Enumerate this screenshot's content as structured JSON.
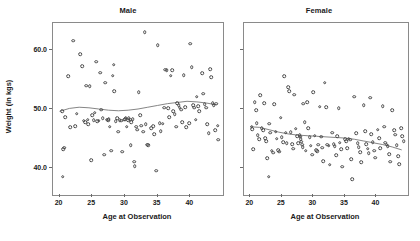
{
  "figure": {
    "background": "#ffffff",
    "marker_color": "#4a4a4a",
    "trend_color": "#777777",
    "frame_color": "#8a8a8a"
  },
  "chart_data": {
    "type": "scatter",
    "title": "",
    "xlabel": "Age at Observation",
    "ylabel": "Weight (in kgs)",
    "xlim": [
      19,
      45
    ],
    "ylim": [
      35.5,
      64.5
    ],
    "xticks": [
      20,
      25,
      30,
      35,
      40
    ],
    "yticks": [
      40.0,
      50.0,
      60.0
    ],
    "ytick_labels": [
      "40.0",
      "50.0",
      "60.0"
    ],
    "xtick_labels": [
      "20",
      "25",
      "30",
      "35",
      "40"
    ],
    "grid": false,
    "legend": "none",
    "panels": [
      {
        "label": "Male",
        "trend_line": {
          "x": [
            20.0,
            21.5,
            23.0,
            24.5,
            26.0,
            27.5,
            29.0,
            30.5,
            32.0,
            33.5,
            35.0,
            36.5,
            38.0,
            39.5,
            41.0,
            42.5,
            44.0
          ],
          "y": [
            49.6,
            50.1,
            50.3,
            50.2,
            50.0,
            49.8,
            49.7,
            49.8,
            50.0,
            50.3,
            50.6,
            50.9,
            51.1,
            51.3,
            51.2,
            51.0,
            50.7
          ]
        },
        "points": [
          [
            20.4,
            49.6
          ],
          [
            20.6,
            43.2
          ],
          [
            20.7,
            43.5
          ],
          [
            20.5,
            38.6
          ],
          [
            20.9,
            48.6
          ],
          [
            21.3,
            55.5
          ],
          [
            21.6,
            46.9
          ],
          [
            22.1,
            61.5
          ],
          [
            22.4,
            47.1
          ],
          [
            22.6,
            49.2
          ],
          [
            23.2,
            59.2
          ],
          [
            23.5,
            57.2
          ],
          [
            23.7,
            48.0
          ],
          [
            23.9,
            47.8
          ],
          [
            24.1,
            53.9
          ],
          [
            24.3,
            48.2
          ],
          [
            24.4,
            47.4
          ],
          [
            24.6,
            53.8
          ],
          [
            24.8,
            41.4
          ],
          [
            25.0,
            49.0
          ],
          [
            25.2,
            48.1
          ],
          [
            25.4,
            49.4
          ],
          [
            25.6,
            58.0
          ],
          [
            25.8,
            47.9
          ],
          [
            26.0,
            48.0
          ],
          [
            26.2,
            56.1
          ],
          [
            26.4,
            49.9
          ],
          [
            26.6,
            48.4
          ],
          [
            26.8,
            42.3
          ],
          [
            27.0,
            54.4
          ],
          [
            27.2,
            48.2
          ],
          [
            27.4,
            48.1
          ],
          [
            27.5,
            48.3
          ],
          [
            27.7,
            47.0
          ],
          [
            27.9,
            43.0
          ],
          [
            28.1,
            55.6
          ],
          [
            28.3,
            57.5
          ],
          [
            28.4,
            53.0
          ],
          [
            28.6,
            47.9
          ],
          [
            28.8,
            48.4
          ],
          [
            29.0,
            46.2
          ],
          [
            29.2,
            48.1
          ],
          [
            29.4,
            48.0
          ],
          [
            29.6,
            42.8
          ],
          [
            29.9,
            48.2
          ],
          [
            30.0,
            48.3
          ],
          [
            30.1,
            48.5
          ],
          [
            30.3,
            47.0
          ],
          [
            30.5,
            48.1
          ],
          [
            30.6,
            48.4
          ],
          [
            30.8,
            48.2
          ],
          [
            30.9,
            43.9
          ],
          [
            31.0,
            47.8
          ],
          [
            31.2,
            48.3
          ],
          [
            31.4,
            41.1
          ],
          [
            31.5,
            40.4
          ],
          [
            31.7,
            47.0
          ],
          [
            31.9,
            46.5
          ],
          [
            32.1,
            52.8
          ],
          [
            32.3,
            49.0
          ],
          [
            32.5,
            47.2
          ],
          [
            32.8,
            46.2
          ],
          [
            33.0,
            62.9
          ],
          [
            33.2,
            47.4
          ],
          [
            33.4,
            44.0
          ],
          [
            33.6,
            43.9
          ],
          [
            34.0,
            46.8
          ],
          [
            34.3,
            47.1
          ],
          [
            34.5,
            45.8
          ],
          [
            34.8,
            39.6
          ],
          [
            35.0,
            60.8
          ],
          [
            35.3,
            47.6
          ],
          [
            35.5,
            46.3
          ],
          [
            35.8,
            47.5
          ],
          [
            36.0,
            50.2
          ],
          [
            36.2,
            56.6
          ],
          [
            36.4,
            56.5
          ],
          [
            36.6,
            50.1
          ],
          [
            36.8,
            48.6
          ],
          [
            37.0,
            55.6
          ],
          [
            37.2,
            56.5
          ],
          [
            37.4,
            49.6
          ],
          [
            37.6,
            49.1
          ],
          [
            37.8,
            47.0
          ],
          [
            38.0,
            51.0
          ],
          [
            38.2,
            50.6
          ],
          [
            38.4,
            50.2
          ],
          [
            38.6,
            49.9
          ],
          [
            38.8,
            47.8
          ],
          [
            39.0,
            55.7
          ],
          [
            39.2,
            50.3
          ],
          [
            39.4,
            46.9
          ],
          [
            39.8,
            47.6
          ],
          [
            40.0,
            61.0
          ],
          [
            40.2,
            57.0
          ],
          [
            40.4,
            50.6
          ],
          [
            40.6,
            50.2
          ],
          [
            40.8,
            48.2
          ],
          [
            41.0,
            52.1
          ],
          [
            41.2,
            50.5
          ],
          [
            41.4,
            49.6
          ],
          [
            41.8,
            56.0
          ],
          [
            42.0,
            52.6
          ],
          [
            42.2,
            50.8
          ],
          [
            42.4,
            50.2
          ],
          [
            42.6,
            47.4
          ],
          [
            42.8,
            45.9
          ],
          [
            43.0,
            56.7
          ],
          [
            43.2,
            55.4
          ],
          [
            43.4,
            51.0
          ],
          [
            43.6,
            50.6
          ],
          [
            43.8,
            46.4
          ],
          [
            44.0,
            50.9
          ],
          [
            44.2,
            47.2
          ],
          [
            44.3,
            44.8
          ]
        ]
      },
      {
        "label": "Female",
        "trend_line": {
          "x": [
            20.0,
            21.5,
            23.0,
            24.5,
            26.0,
            27.5,
            29.0,
            30.5,
            32.0,
            33.5,
            35.0,
            36.5,
            38.0,
            39.5,
            41.0,
            42.5,
            44.0
          ],
          "y": [
            47.0,
            46.9,
            46.5,
            46.1,
            45.8,
            45.6,
            45.5,
            45.4,
            45.3,
            45.2,
            45.1,
            44.9,
            44.6,
            44.3,
            44.0,
            43.6,
            43.1
          ]
        },
        "points": [
          [
            20.2,
            47.0
          ],
          [
            20.3,
            46.6
          ],
          [
            20.5,
            43.2
          ],
          [
            20.7,
            51.1
          ],
          [
            20.9,
            49.8
          ],
          [
            21.0,
            47.6
          ],
          [
            21.2,
            45.6
          ],
          [
            21.4,
            44.9
          ],
          [
            21.6,
            52.3
          ],
          [
            21.8,
            46.8
          ],
          [
            22.0,
            46.4
          ],
          [
            22.2,
            51.0
          ],
          [
            22.4,
            45.1
          ],
          [
            22.5,
            44.6
          ],
          [
            22.7,
            41.7
          ],
          [
            22.9,
            38.6
          ],
          [
            23.0,
            47.5
          ],
          [
            23.2,
            46.0
          ],
          [
            23.4,
            43.0
          ],
          [
            23.6,
            42.6
          ],
          [
            23.8,
            50.8
          ],
          [
            24.0,
            46.2
          ],
          [
            24.2,
            45.0
          ],
          [
            24.4,
            43.1
          ],
          [
            24.6,
            42.8
          ],
          [
            24.8,
            48.5
          ],
          [
            25.0,
            45.2
          ],
          [
            25.2,
            44.4
          ],
          [
            25.4,
            55.5
          ],
          [
            25.6,
            46.0
          ],
          [
            25.8,
            44.2
          ],
          [
            26.0,
            53.7
          ],
          [
            26.2,
            53.0
          ],
          [
            26.4,
            46.1
          ],
          [
            26.6,
            44.1
          ],
          [
            26.8,
            43.3
          ],
          [
            27.0,
            52.4
          ],
          [
            27.2,
            46.7
          ],
          [
            27.4,
            45.4
          ],
          [
            27.6,
            44.2
          ],
          [
            27.8,
            45.6
          ],
          [
            27.9,
            45.3
          ],
          [
            28.0,
            44.9
          ],
          [
            28.1,
            44.5
          ],
          [
            28.2,
            44.0
          ],
          [
            28.3,
            43.6
          ],
          [
            28.4,
            50.9
          ],
          [
            28.6,
            47.8
          ],
          [
            28.8,
            43.0
          ],
          [
            29.0,
            51.1
          ],
          [
            29.2,
            46.8
          ],
          [
            29.4,
            45.2
          ],
          [
            29.6,
            43.8
          ],
          [
            29.8,
            42.3
          ],
          [
            30.0,
            52.8
          ],
          [
            30.2,
            45.5
          ],
          [
            30.4,
            43.1
          ],
          [
            30.6,
            42.9
          ],
          [
            30.8,
            44.0
          ],
          [
            31.0,
            50.4
          ],
          [
            31.2,
            45.3
          ],
          [
            31.4,
            43.5
          ],
          [
            31.6,
            41.2
          ],
          [
            31.8,
            54.4
          ],
          [
            32.0,
            50.3
          ],
          [
            32.2,
            44.0
          ],
          [
            32.4,
            43.8
          ],
          [
            32.6,
            40.6
          ],
          [
            33.0,
            46.0
          ],
          [
            33.2,
            44.1
          ],
          [
            33.4,
            43.7
          ],
          [
            33.6,
            42.2
          ],
          [
            33.8,
            45.4
          ],
          [
            34.0,
            50.1
          ],
          [
            34.2,
            44.3
          ],
          [
            34.4,
            43.2
          ],
          [
            34.6,
            40.3
          ],
          [
            35.0,
            44.9
          ],
          [
            35.2,
            44.6
          ],
          [
            35.4,
            43.4
          ],
          [
            35.6,
            45.0
          ],
          [
            35.8,
            44.8
          ],
          [
            36.0,
            41.5
          ],
          [
            36.2,
            38.2
          ],
          [
            36.5,
            52.1
          ],
          [
            36.8,
            45.9
          ],
          [
            37.0,
            44.2
          ],
          [
            37.2,
            43.6
          ],
          [
            37.4,
            42.7
          ],
          [
            37.6,
            41.0
          ],
          [
            38.0,
            50.6
          ],
          [
            38.2,
            46.3
          ],
          [
            38.4,
            44.1
          ],
          [
            38.6,
            43.3
          ],
          [
            38.8,
            42.5
          ],
          [
            39.0,
            51.9
          ],
          [
            39.2,
            45.8
          ],
          [
            39.4,
            44.4
          ],
          [
            39.6,
            43.0
          ],
          [
            39.8,
            41.8
          ],
          [
            40.2,
            46.5
          ],
          [
            40.4,
            45.1
          ],
          [
            40.6,
            43.4
          ],
          [
            41.0,
            50.5
          ],
          [
            41.2,
            47.0
          ],
          [
            41.4,
            44.3
          ],
          [
            41.6,
            44.0
          ],
          [
            41.8,
            43.7
          ],
          [
            42.0,
            42.4
          ],
          [
            42.2,
            41.1
          ],
          [
            42.5,
            49.8
          ],
          [
            42.8,
            46.4
          ],
          [
            43.0,
            45.7
          ],
          [
            43.2,
            43.9
          ],
          [
            43.4,
            42.0
          ],
          [
            43.6,
            40.7
          ],
          [
            43.9,
            46.8
          ],
          [
            44.1,
            45.4
          ],
          [
            44.3,
            44.6
          ]
        ]
      }
    ]
  }
}
